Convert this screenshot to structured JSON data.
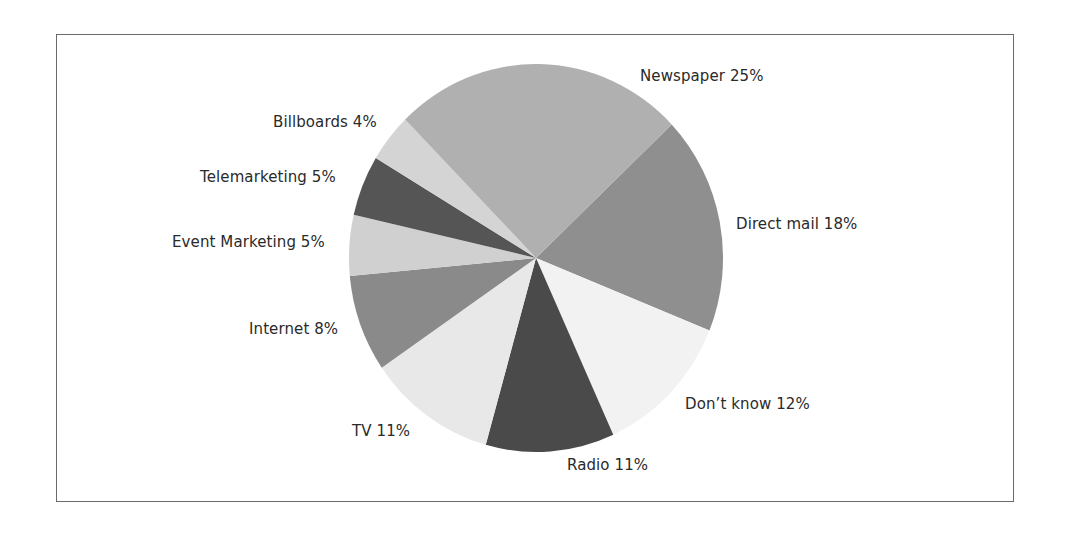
{
  "chart_data": {
    "type": "pie",
    "title": "",
    "start_angle_deg": -43.5,
    "direction": "clockwise",
    "center": [
      536,
      258
    ],
    "radius": [
      187,
      194
    ],
    "slices": [
      {
        "label": "Direct mail",
        "value": 18,
        "text": "Direct mail 18%",
        "color": "#8f8f8f",
        "label_pos": [
          736,
          215
        ]
      },
      {
        "label": "Don't know",
        "value": 12,
        "text": "Don’t know 12%",
        "color": "#f2f2f2",
        "label_pos": [
          685,
          395
        ]
      },
      {
        "label": "Radio",
        "value": 11,
        "text": "Radio 11%",
        "color": "#4a4a4a",
        "label_pos": [
          567,
          456
        ]
      },
      {
        "label": "TV",
        "value": 11,
        "text": "TV 11%",
        "color": "#e8e8e8",
        "label_pos": [
          352,
          422
        ]
      },
      {
        "label": "Internet",
        "value": 8,
        "text": "Internet 8%",
        "color": "#8a8a8a",
        "label_pos": [
          249,
          320
        ]
      },
      {
        "label": "Event Marketing",
        "value": 5,
        "text": "Event Marketing 5%",
        "color": "#d0d0d0",
        "label_pos": [
          172,
          233
        ]
      },
      {
        "label": "Telemarketing",
        "value": 5,
        "text": "Telemarketing 5%",
        "color": "#555555",
        "label_pos": [
          200,
          168
        ]
      },
      {
        "label": "Billboards",
        "value": 4,
        "text": "Billboards 4%",
        "color": "#d4d4d4",
        "label_pos": [
          273,
          113
        ]
      },
      {
        "label": "Newspaper",
        "value": 25,
        "text": "Newspaper 25%",
        "color": "#b0b0b0",
        "label_pos": [
          640,
          67
        ]
      }
    ]
  }
}
